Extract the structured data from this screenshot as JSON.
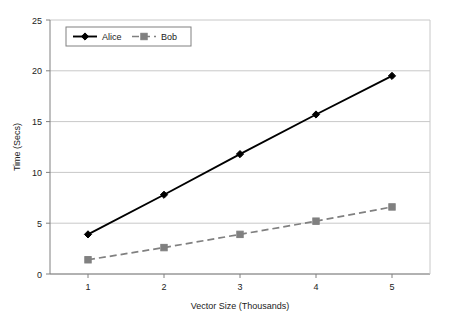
{
  "chart_data": {
    "type": "line",
    "title": "",
    "xlabel": "Vector Size (Thousands)",
    "ylabel": "Time (Secs)",
    "x": [
      1,
      2,
      3,
      4,
      5
    ],
    "xticklabels": [
      "1",
      "2",
      "3",
      "4",
      "5"
    ],
    "yticklabels": [
      "0",
      "5",
      "10",
      "15",
      "20",
      "25"
    ],
    "yticks": [
      0,
      5,
      10,
      15,
      20,
      25
    ],
    "xlim": [
      0.5,
      5.5
    ],
    "ylim": [
      0,
      25
    ],
    "grid": "horizontal",
    "legend_position": "top-left-inside",
    "series": [
      {
        "name": "Alice",
        "values": [
          3.9,
          7.8,
          11.8,
          15.7,
          19.5
        ],
        "color": "#000000",
        "linestyle": "solid",
        "marker": "diamond"
      },
      {
        "name": "Bob",
        "values": [
          1.4,
          2.6,
          3.9,
          5.2,
          6.6
        ],
        "color": "#808080",
        "linestyle": "dashed",
        "marker": "square"
      }
    ]
  },
  "axes": {
    "y_label": "Time (Secs)",
    "x_label": "Vector Size (Thousands)"
  },
  "legend": {
    "entries": [
      {
        "label": "Alice"
      },
      {
        "label": "Bob"
      }
    ]
  },
  "colors": {
    "alice": "#000000",
    "bob": "#808080",
    "grid": "#c8c8c8",
    "axis": "#808080",
    "background": "#ffffff"
  }
}
